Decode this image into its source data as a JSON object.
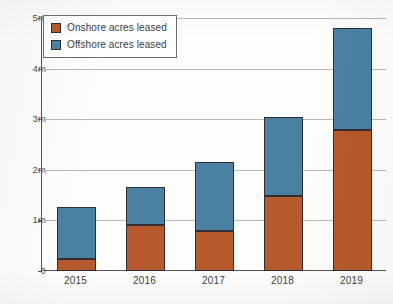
{
  "chart_data": {
    "type": "bar",
    "subtype": "stacked-bar",
    "title": "",
    "xlabel": "",
    "ylabel": "",
    "categories": [
      "2015",
      "2016",
      "2017",
      "2018",
      "2019"
    ],
    "series": [
      {
        "name": "Onshore acres leased",
        "color": "#b75a2d",
        "values": [
          0.24,
          0.91,
          0.79,
          1.48,
          2.79
        ]
      },
      {
        "name": "Offshore acres leased",
        "color": "#4a81a3",
        "values": [
          1.03,
          0.75,
          1.36,
          1.57,
          2.01
        ]
      }
    ],
    "totals": [
      1.27,
      1.66,
      2.15,
      3.05,
      4.8
    ],
    "ylim": [
      0,
      5
    ],
    "y_ticks": [
      0,
      1,
      2,
      3,
      4,
      5
    ],
    "y_tick_labels": [
      "0",
      "1m",
      "2m",
      "3m",
      "4m",
      "5m"
    ],
    "grid": true,
    "grid_axis": "y",
    "legend_position": "top-left",
    "units": "millions of acres"
  },
  "legend": {
    "items": [
      {
        "label": "Onshore acres leased",
        "swatch_color": "#b75a2d"
      },
      {
        "label": "Offshore acres leased",
        "swatch_color": "#4a81a3"
      }
    ]
  },
  "axis_colors": {
    "axis_line": "#56565a",
    "gridline": "#b9b9bb",
    "bar_outline": "#2f2f33",
    "text": "#3b3b3e",
    "background": "#fdfdfc"
  }
}
